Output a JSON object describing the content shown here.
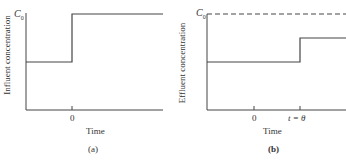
{
  "panels": [
    {
      "id": "a",
      "caption": "(a)",
      "ylabel": "Influent concentration",
      "xlabel": "Time",
      "level_label": "C",
      "level_sub": "0",
      "ticks": [
        "0"
      ]
    },
    {
      "id": "b",
      "caption": "(b)",
      "ylabel": "Effluent concentration",
      "xlabel": "Time",
      "level_label": "C",
      "level_sub": "0",
      "ticks": [
        "0",
        "t = θ"
      ]
    }
  ],
  "colors": {
    "line": "#444444",
    "text": "#333333"
  }
}
